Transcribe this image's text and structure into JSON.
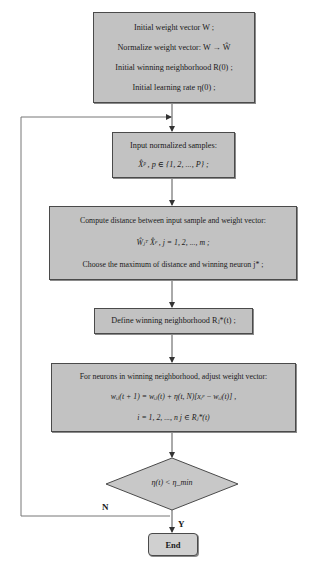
{
  "flowchart": {
    "nodes": [
      {
        "id": "init",
        "shape": "rectangle",
        "lines": [
          "Initial weight vector  W ;",
          "Normalize weight vector:  W → Ŵ",
          "Initial winning neighborhood  R(0) ;",
          "Initial learning rate  η(0) ;"
        ]
      },
      {
        "id": "input",
        "shape": "rectangle",
        "lines": [
          "Input normalized samples:",
          "X̂ᵖ ,  p ∈ {1, 2, ..., P} ;"
        ]
      },
      {
        "id": "compute",
        "shape": "rectangle",
        "lines": [
          "Compute distance between input sample and weight vector:",
          "Ŵⱼᵀ X̂ᵖ ,  j = 1, 2, ..., m ;",
          "Choose the maximum of distance and winning neuron  j* ;"
        ]
      },
      {
        "id": "define",
        "shape": "rectangle",
        "lines": [
          "Define winning neighborhood  Rⱼ*(t) ;"
        ]
      },
      {
        "id": "adjust",
        "shape": "rectangle",
        "lines": [
          "For neurons in winning neighborhood, adjust weight vector:",
          "wᵢⱼ(t + 1) = wᵢⱼ(t) + η(t, N)[xᵢᵖ − wᵢⱼ(t)] ,",
          "i = 1, 2, ..., n    j ∈ Rⱼ*(t)"
        ]
      },
      {
        "id": "decision",
        "shape": "diamond",
        "text": "η(t) < η_min"
      },
      {
        "id": "end",
        "shape": "rounded-rectangle",
        "text": "End"
      }
    ],
    "edges": [
      {
        "from": "init",
        "to": "input",
        "label": ""
      },
      {
        "from": "input",
        "to": "compute",
        "label": ""
      },
      {
        "from": "compute",
        "to": "define",
        "label": ""
      },
      {
        "from": "define",
        "to": "adjust",
        "label": ""
      },
      {
        "from": "adjust",
        "to": "decision",
        "label": ""
      },
      {
        "from": "decision",
        "to": "end",
        "label": "Y"
      },
      {
        "from": "decision",
        "to": "input",
        "label": "N"
      }
    ],
    "labels": {
      "no": "N",
      "yes": "Y"
    },
    "colors": {
      "box_fill": "#c2c2c2",
      "border": "#4a4a4a",
      "line": "#555555"
    }
  }
}
